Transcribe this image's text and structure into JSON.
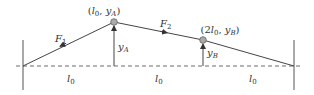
{
  "diagram": {
    "type": "string-with-two-masses",
    "point_a": {
      "label_prefix": "(",
      "x_var": "l",
      "x_sub": "0",
      "sep": ", ",
      "y_var": "y",
      "y_sub": "A",
      "label_suffix": ")"
    },
    "point_b": {
      "label_prefix": "(2",
      "x_var": "l",
      "x_sub": "0",
      "sep": ", ",
      "y_var": "y",
      "y_sub": "B",
      "label_suffix": ")"
    },
    "force_1": {
      "var": "F",
      "sub": "1"
    },
    "force_2": {
      "var": "F",
      "sub": "2"
    },
    "height_a": {
      "var": "y",
      "sub": "A"
    },
    "height_b": {
      "var": "y",
      "sub": "B"
    },
    "segments": [
      {
        "var": "l",
        "sub": "0"
      },
      {
        "var": "l",
        "sub": "0"
      },
      {
        "var": "l",
        "sub": "0"
      }
    ],
    "colors": {
      "line": "#444444",
      "mass_fill": "#aaaaaa",
      "text": "#333333"
    }
  }
}
